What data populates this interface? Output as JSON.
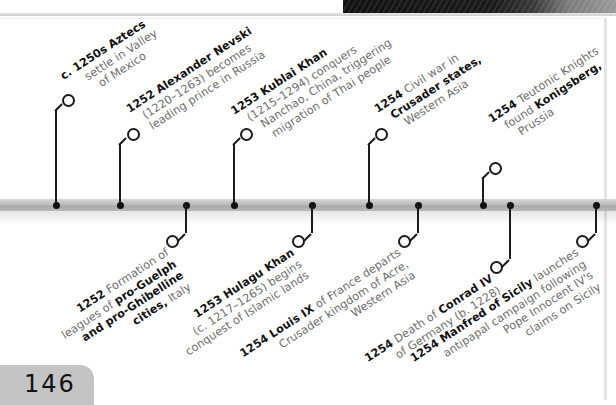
{
  "page": {
    "number": "146",
    "accent_colors": {
      "timeline_bar": "#b5b5b5",
      "text_bold": "#111111",
      "text_body": "#6d6d6d",
      "page_tab": "#c4c4c4"
    }
  },
  "timeline": {
    "above": [
      {
        "year": "c. 1250s",
        "title": "Aztecs",
        "lines": [
          "settle in Valley",
          "of Mexico"
        ]
      },
      {
        "year": "1252",
        "title": "Alexander Nevski",
        "lines": [
          "(1220–1263) becomes",
          "leading prince in Russia"
        ]
      },
      {
        "year": "1253",
        "title": "Kublai Khan",
        "lines": [
          "(1215–1294) conquers",
          "Nanchao, China, triggering",
          "migration of Thai people"
        ]
      },
      {
        "year": "1254",
        "pre": "Civil war in",
        "title": "Crusader states,",
        "lines": [
          "Western Asia"
        ]
      },
      {
        "year": "1254",
        "pre": "Teutonic Knights",
        "mid": "found",
        "title": "Konigsberg,",
        "lines": [
          "Prussia"
        ]
      }
    ],
    "below": [
      {
        "year": "1252",
        "pre": "Formation of",
        "l2a": "leagues of",
        "b2": "pro-Guelph",
        "b3": "and pro-Ghibelline",
        "b4": "cities,",
        "l4": "Italy"
      },
      {
        "year": "1253",
        "title": "Hulagu Khan",
        "lines": [
          "(c. 1217–1265) begins",
          "conquest of Islamic lands"
        ]
      },
      {
        "year": "1254",
        "title": "Louis IX",
        "post": "of France departs",
        "lines": [
          "Crusader kingdom of Acre,",
          "Western Asia"
        ]
      },
      {
        "year": "1254",
        "pre": "Death of",
        "title": "Conrad IV",
        "lines": [
          "of Germany (b. 1228)"
        ]
      },
      {
        "year": "1254",
        "title": "Manfred of Sicily",
        "post": "launches",
        "lines": [
          "antipapal campaign following",
          "Pope Innocent IV's",
          "claims on Sicily"
        ]
      }
    ]
  }
}
